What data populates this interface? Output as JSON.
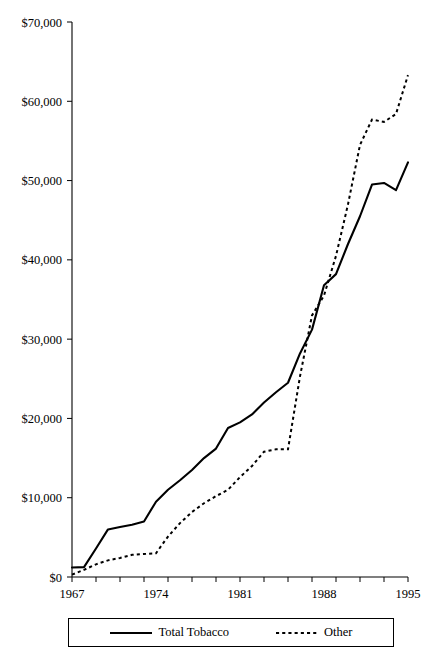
{
  "chart_data": {
    "type": "line",
    "title": "",
    "xlabel": "",
    "ylabel": "",
    "xlim": [
      1967,
      1995
    ],
    "ylim": [
      0,
      70000
    ],
    "grid": false,
    "legend_position": "bottom",
    "y_ticks": [
      0,
      10000,
      20000,
      30000,
      40000,
      50000,
      60000,
      70000
    ],
    "y_tick_labels": [
      "$0",
      "$10,000",
      "$20,000",
      "$30,000",
      "$40,000",
      "$50,000",
      "$60,000",
      "$70,000"
    ],
    "x_ticks": [
      1967,
      1969,
      1971,
      1973,
      1975,
      1977,
      1979,
      1981,
      1983,
      1985,
      1987,
      1989,
      1991,
      1993,
      1995
    ],
    "x_tick_labels": [
      "1967",
      "",
      "",
      "",
      "",
      "",
      "",
      "1981",
      "",
      "",
      "",
      "",
      "",
      "",
      "1995"
    ],
    "x_labeled_ticks": [
      {
        "year": 1967,
        "label": "1967"
      },
      {
        "year": 1974,
        "label": "1974"
      },
      {
        "year": 1981,
        "label": "1981"
      },
      {
        "year": 1988,
        "label": "1988"
      },
      {
        "year": 1995,
        "label": "1995"
      }
    ],
    "x": [
      1967,
      1968,
      1969,
      1970,
      1971,
      1972,
      1973,
      1974,
      1975,
      1976,
      1977,
      1978,
      1979,
      1980,
      1981,
      1982,
      1983,
      1984,
      1985,
      1986,
      1987,
      1988,
      1989,
      1990,
      1991,
      1992,
      1993,
      1994,
      1995
    ],
    "series": [
      {
        "name": "Total Tobacco",
        "style": "solid",
        "color": "#000000",
        "values": [
          1200,
          1250,
          3600,
          6000,
          6300,
          6600,
          7000,
          9500,
          11000,
          12200,
          13500,
          15000,
          16200,
          18800,
          19500,
          20500,
          22000,
          23300,
          24500,
          28200,
          31200,
          36800,
          38200,
          42000,
          45500,
          49500,
          49700,
          48800,
          52300
        ]
      },
      {
        "name": "Other",
        "style": "dashed",
        "color": "#000000",
        "values": [
          300,
          900,
          1600,
          2100,
          2400,
          2800,
          2900,
          3000,
          5100,
          6800,
          8200,
          9300,
          10200,
          11000,
          12600,
          14000,
          15800,
          16100,
          16100,
          25300,
          33000,
          35500,
          40500,
          47000,
          54500,
          57700,
          57400,
          58400,
          63300
        ]
      }
    ],
    "legend": [
      {
        "label": "Total Tobacco",
        "style": "solid"
      },
      {
        "label": "Other",
        "style": "dashed"
      }
    ]
  }
}
